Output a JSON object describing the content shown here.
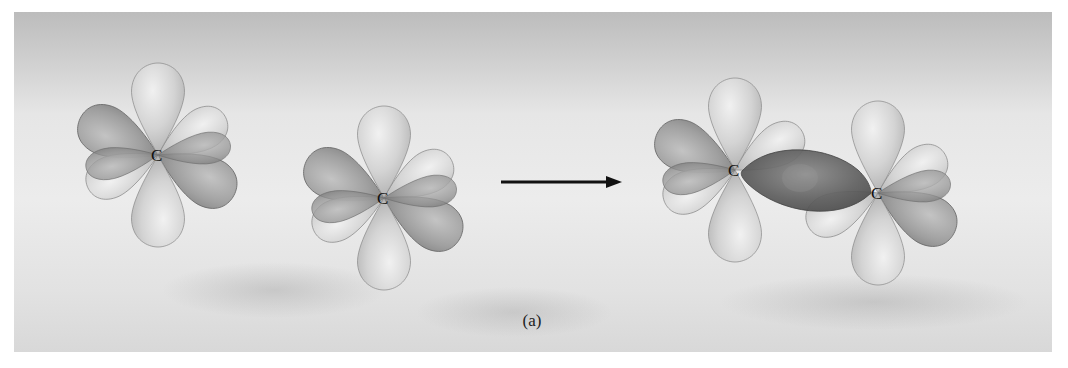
{
  "figure": {
    "caption": "(a)",
    "background_color": "#e8e8e8",
    "lobe_colors": {
      "light": "#d4d4d4",
      "dark": "#9a9a9a",
      "bond": "#6e6e6e",
      "outline": "#7a7a7a"
    },
    "atoms": [
      {
        "label": "C",
        "x": 158,
        "y": 155,
        "group": "isolated-1"
      },
      {
        "label": "C",
        "x": 384,
        "y": 198,
        "group": "isolated-2"
      },
      {
        "label": "C",
        "x": 735,
        "y": 170,
        "group": "bonded-left"
      },
      {
        "label": "C",
        "x": 878,
        "y": 193,
        "group": "bonded-right"
      }
    ],
    "arrow": {
      "label": "",
      "from_x": 500,
      "to_x": 622,
      "y": 182
    }
  }
}
